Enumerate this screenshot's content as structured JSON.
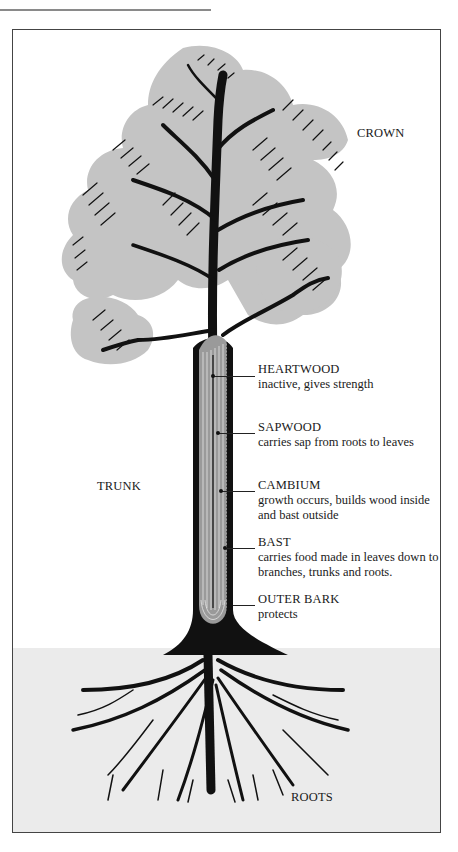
{
  "diagram": {
    "colors": {
      "frame_border": "#444444",
      "ground": "#ebebeb",
      "foliage": "#c4c4c4",
      "ink": "#111111",
      "trunk_inner": "#9a9a9a"
    },
    "regions": {
      "crown": "CROWN",
      "trunk": "TRUNK",
      "roots": "ROOTS"
    },
    "layers": [
      {
        "name": "HEARTWOOD",
        "description": "inactive, gives strength"
      },
      {
        "name": "SAPWOOD",
        "description": "carries sap from roots to leaves"
      },
      {
        "name": "CAMBIUM",
        "description": "growth occurs, builds wood inside",
        "description_line2": "and bast outside"
      },
      {
        "name": "BAST",
        "description": "carries food made in leaves down to",
        "description_line2": "branches, trunks and roots."
      },
      {
        "name": "OUTER BARK",
        "description": "protects"
      }
    ]
  }
}
